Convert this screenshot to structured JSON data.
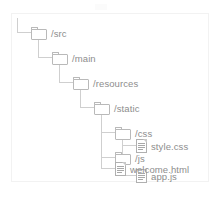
{
  "diagram": {
    "type": "file-tree",
    "caption": "",
    "nodes": [
      {
        "id": "src",
        "label": "/src",
        "kind": "folder",
        "depth": 0
      },
      {
        "id": "main",
        "label": "/main",
        "kind": "folder",
        "depth": 1
      },
      {
        "id": "resources",
        "label": "/resources",
        "kind": "folder",
        "depth": 2
      },
      {
        "id": "static",
        "label": "/static",
        "kind": "folder",
        "depth": 3
      },
      {
        "id": "css",
        "label": "/css",
        "kind": "folder",
        "depth": 4
      },
      {
        "id": "style_css",
        "label": "style.css",
        "kind": "file",
        "depth": 5
      },
      {
        "id": "js",
        "label": "/js",
        "kind": "folder",
        "depth": 4
      },
      {
        "id": "app_js",
        "label": "app.js",
        "kind": "file",
        "depth": 5
      },
      {
        "id": "welcome_html",
        "label": "welcome.html",
        "kind": "file",
        "depth": 4
      }
    ]
  },
  "colors": {
    "text": "#8d8d8d",
    "icon_outline": "#b9b9b9",
    "connector": "#cfcfcf",
    "box_border": "#f2f2f2",
    "background": "#ffffff"
  }
}
